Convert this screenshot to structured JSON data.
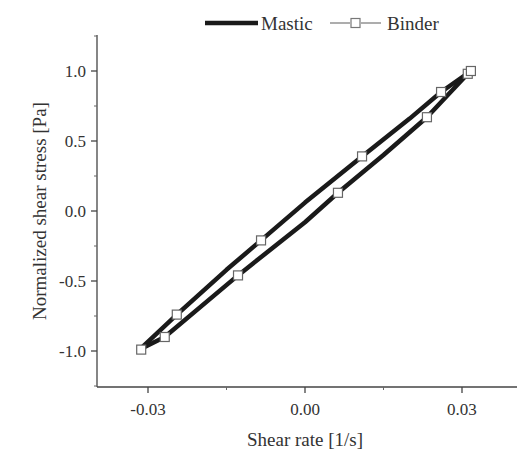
{
  "chart_data": {
    "type": "line",
    "title": "",
    "xlabel": "Shear rate [1/s]",
    "ylabel": "Normalized shear stress [Pa]",
    "xlim": [
      -0.0355,
      0.0405
    ],
    "ylim": [
      -1.26,
      1.26
    ],
    "xticks": [
      -0.03,
      0.0,
      0.03
    ],
    "xtick_labels": [
      "-0.03",
      "0.00",
      "0.03"
    ],
    "yticks": [
      1.0,
      0.5,
      0.0,
      -0.5,
      -1.0
    ],
    "ytick_labels": [
      "1.0",
      "0.5",
      "0.0",
      "-0.5",
      "-1.0"
    ],
    "grid": false,
    "legend_position": "top",
    "series": [
      {
        "name": "Mastic",
        "style": "solid thick line, no markers",
        "color": "#1a1a1a",
        "loop_upper": {
          "x": [
            -0.0316,
            -0.0245,
            -0.015,
            -0.0084,
            0.0,
            0.0109,
            0.02,
            0.026,
            0.0317
          ],
          "y": [
            -0.99,
            -0.74,
            -0.42,
            -0.21,
            0.06,
            0.39,
            0.66,
            0.85,
            1.0
          ]
        },
        "loop_lower": {
          "x": [
            -0.0316,
            -0.0268,
            -0.0128,
            0.0,
            0.0063,
            0.015,
            0.0233,
            0.0311,
            0.0317
          ],
          "y": [
            -0.99,
            -0.9,
            -0.46,
            -0.08,
            0.13,
            0.4,
            0.67,
            0.98,
            1.0
          ]
        }
      },
      {
        "name": "Binder",
        "style": "line with open square markers",
        "color": "#555555",
        "marker": "open-square",
        "x": [
          -0.0313,
          -0.0268,
          -0.0245,
          -0.0128,
          -0.0084,
          0.0063,
          0.0109,
          0.0233,
          0.026,
          0.0311,
          0.0317
        ],
        "y": [
          -0.99,
          -0.9,
          -0.74,
          -0.46,
          -0.21,
          0.13,
          0.39,
          0.67,
          0.85,
          0.98,
          1.0
        ]
      }
    ],
    "legend": [
      {
        "label": "Mastic",
        "symbol": "thick-line"
      },
      {
        "label": "Binder",
        "symbol": "line-open-square"
      }
    ]
  },
  "layout": {
    "plot_left_px": 97,
    "plot_top_px": 35,
    "plot_bottom_px": 387,
    "plot_right_px": 517,
    "x_zero_px": 305,
    "x_px_per_unit": 5233.3,
    "y_zero_px": 211,
    "y_px_per_unit": 140
  },
  "colors": {
    "axis": "#444444",
    "mastic_line": "#1a1a1a",
    "marker_stroke": "#666666",
    "marker_fill": "#ffffff",
    "text": "#333333"
  }
}
